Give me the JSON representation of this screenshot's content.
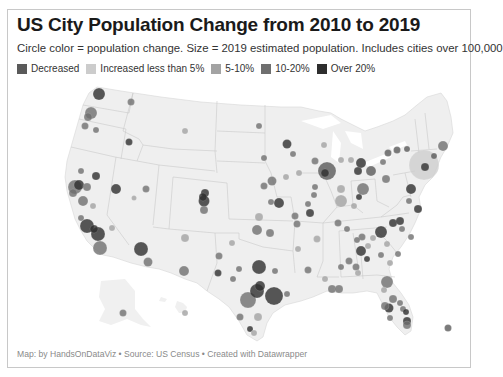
{
  "header": {
    "title": "US City Population Change from 2010 to 2019",
    "subtitle": "Circle color = population change. Size = 2019 estimated population. Includes cities over 100,000"
  },
  "legend": {
    "items": [
      {
        "label": "Decreased",
        "color": "#5a5a5a"
      },
      {
        "label": "Increased less than 5%",
        "color": "#cccccc"
      },
      {
        "label": "5-10%",
        "color": "#a3a3a3"
      },
      {
        "label": "10-20%",
        "color": "#6f6f6f"
      },
      {
        "label": "Over 20%",
        "color": "#2e2e2e"
      }
    ]
  },
  "footer": {
    "text": "Map: by HandsOnDataViz • Source: US Census • Created with Datawrapper"
  },
  "chart_data": {
    "type": "scatter",
    "subtype": "proportional-symbol map",
    "title": "US City Population Change from 2010 to 2019",
    "subtitle": "Circle color = population change. Size = 2019 estimated population. Includes cities over 100,000",
    "legend_position": "top",
    "legend": [
      "Decreased",
      "Increased less than 5%",
      "5-10%",
      "10-20%",
      "Over 20%"
    ],
    "encoding": {
      "color": "population change category",
      "size": "2019 estimated population"
    },
    "source": "US Census",
    "credit": "Map: by HandsOnDataViz",
    "points": [
      {
        "x": 98,
        "y": 93,
        "r": 6,
        "cat": "Over 20%"
      },
      {
        "x": 130,
        "y": 101,
        "r": 3.5,
        "cat": "10-20%"
      },
      {
        "x": 90,
        "y": 112,
        "r": 6,
        "cat": "10-20%"
      },
      {
        "x": 87,
        "y": 116,
        "r": 4,
        "cat": "10-20%"
      },
      {
        "x": 84,
        "y": 125,
        "r": 3.5,
        "cat": "10-20%"
      },
      {
        "x": 95,
        "y": 129,
        "r": 3,
        "cat": "10-20%"
      },
      {
        "x": 128,
        "y": 141,
        "r": 3.5,
        "cat": "Over 20%"
      },
      {
        "x": 184,
        "y": 130,
        "r": 3,
        "cat": "5-10%"
      },
      {
        "x": 80,
        "y": 170,
        "r": 3,
        "cat": "10-20%"
      },
      {
        "x": 95,
        "y": 175,
        "r": 4,
        "cat": "Over 20%"
      },
      {
        "x": 74,
        "y": 186,
        "r": 7,
        "cat": "10-20%"
      },
      {
        "x": 78,
        "y": 184,
        "r": 5,
        "cat": "Over 20%"
      },
      {
        "x": 72,
        "y": 192,
        "r": 4,
        "cat": "10-20%"
      },
      {
        "x": 86,
        "y": 186,
        "r": 4,
        "cat": "10-20%"
      },
      {
        "x": 82,
        "y": 200,
        "r": 5,
        "cat": "10-20%"
      },
      {
        "x": 92,
        "y": 205,
        "r": 3,
        "cat": "5-10%"
      },
      {
        "x": 115,
        "y": 188,
        "r": 5,
        "cat": "Over 20%"
      },
      {
        "x": 145,
        "y": 188,
        "r": 3.5,
        "cat": "10-20%"
      },
      {
        "x": 133,
        "y": 197,
        "r": 2.5,
        "cat": "5-10%"
      },
      {
        "x": 80,
        "y": 217,
        "r": 3,
        "cat": "10-20%"
      },
      {
        "x": 86,
        "y": 225,
        "r": 7,
        "cat": "Over 20%"
      },
      {
        "x": 97,
        "y": 233,
        "r": 7,
        "cat": "Over 20%"
      },
      {
        "x": 93,
        "y": 228,
        "r": 4,
        "cat": "Over 20%"
      },
      {
        "x": 99,
        "y": 247,
        "r": 7,
        "cat": "10-20%"
      },
      {
        "x": 111,
        "y": 227,
        "r": 3,
        "cat": "5-10%"
      },
      {
        "x": 140,
        "y": 248,
        "r": 7,
        "cat": "Over 20%"
      },
      {
        "x": 147,
        "y": 261,
        "r": 4.5,
        "cat": "10-20%"
      },
      {
        "x": 184,
        "y": 237,
        "r": 4,
        "cat": "5-10%"
      },
      {
        "x": 183,
        "y": 270,
        "r": 5,
        "cat": "10-20%"
      },
      {
        "x": 204,
        "y": 192,
        "r": 4,
        "cat": "Over 20%"
      },
      {
        "x": 203,
        "y": 200,
        "r": 5.5,
        "cat": "Over 20%"
      },
      {
        "x": 202,
        "y": 196,
        "r": 4,
        "cat": "Over 20%"
      },
      {
        "x": 203,
        "y": 209,
        "r": 4,
        "cat": "10-20%"
      },
      {
        "x": 258,
        "y": 125,
        "r": 3,
        "cat": "10-20%"
      },
      {
        "x": 263,
        "y": 157,
        "r": 3,
        "cat": "10-20%"
      },
      {
        "x": 271,
        "y": 180,
        "r": 4.5,
        "cat": "10-20%"
      },
      {
        "x": 263,
        "y": 185,
        "r": 3.5,
        "cat": "10-20%"
      },
      {
        "x": 286,
        "y": 143,
        "r": 4.5,
        "cat": "Over 20%"
      },
      {
        "x": 292,
        "y": 153,
        "r": 3,
        "cat": "10-20%"
      },
      {
        "x": 285,
        "y": 176,
        "r": 3,
        "cat": "5-10%"
      },
      {
        "x": 298,
        "y": 172,
        "r": 3,
        "cat": "5-10%"
      },
      {
        "x": 270,
        "y": 201,
        "r": 3,
        "cat": "10-20%"
      },
      {
        "x": 278,
        "y": 202,
        "r": 5,
        "cat": "Over 20%"
      },
      {
        "x": 307,
        "y": 203,
        "r": 3,
        "cat": "10-20%"
      },
      {
        "x": 294,
        "y": 215,
        "r": 3.5,
        "cat": "10-20%"
      },
      {
        "x": 258,
        "y": 216,
        "r": 4,
        "cat": "5-10%"
      },
      {
        "x": 326,
        "y": 170,
        "r": 9,
        "cat": "Decreased"
      },
      {
        "x": 324,
        "y": 172,
        "r": 4,
        "cat": "Over 20%"
      },
      {
        "x": 314,
        "y": 160,
        "r": 3.5,
        "cat": "10-20%"
      },
      {
        "x": 340,
        "y": 159,
        "r": 3,
        "cat": "5-10%"
      },
      {
        "x": 350,
        "y": 159,
        "r": 3,
        "cat": "5-10%"
      },
      {
        "x": 360,
        "y": 162,
        "r": 5,
        "cat": "Over 20%"
      },
      {
        "x": 357,
        "y": 170,
        "r": 4,
        "cat": "Over 20%"
      },
      {
        "x": 323,
        "y": 144,
        "r": 3,
        "cat": "5-10%"
      },
      {
        "x": 314,
        "y": 186,
        "r": 3,
        "cat": "10-20%"
      },
      {
        "x": 313,
        "y": 194,
        "r": 3,
        "cat": "10-20%"
      },
      {
        "x": 340,
        "y": 188,
        "r": 4,
        "cat": "5-10%"
      },
      {
        "x": 340,
        "y": 200,
        "r": 6,
        "cat": "5-10%"
      },
      {
        "x": 362,
        "y": 188,
        "r": 6,
        "cat": "10-20%"
      },
      {
        "x": 358,
        "y": 196,
        "r": 3,
        "cat": "Over 20%"
      },
      {
        "x": 353,
        "y": 205,
        "r": 3,
        "cat": "5-10%"
      },
      {
        "x": 370,
        "y": 170,
        "r": 5,
        "cat": "Decreased"
      },
      {
        "x": 382,
        "y": 161,
        "r": 3,
        "cat": "10-20%"
      },
      {
        "x": 385,
        "y": 178,
        "r": 4,
        "cat": "10-20%"
      },
      {
        "x": 387,
        "y": 152,
        "r": 3.5,
        "cat": "Decreased"
      },
      {
        "x": 396,
        "y": 149,
        "r": 3.5,
        "cat": "Decreased"
      },
      {
        "x": 406,
        "y": 148,
        "r": 3,
        "cat": "Decreased"
      },
      {
        "x": 423,
        "y": 164,
        "r": 15,
        "cat": "Increased less than 5%"
      },
      {
        "x": 424,
        "y": 166,
        "r": 4,
        "cat": "Over 20%"
      },
      {
        "x": 433,
        "y": 155,
        "r": 3,
        "cat": "Decreased"
      },
      {
        "x": 442,
        "y": 145,
        "r": 5,
        "cat": "10-20%"
      },
      {
        "x": 410,
        "y": 188,
        "r": 5,
        "cat": "Over 20%"
      },
      {
        "x": 408,
        "y": 200,
        "r": 3,
        "cat": "10-20%"
      },
      {
        "x": 417,
        "y": 208,
        "r": 4,
        "cat": "Over 20%"
      },
      {
        "x": 256,
        "y": 229,
        "r": 5,
        "cat": "10-20%"
      },
      {
        "x": 269,
        "y": 232,
        "r": 4,
        "cat": "10-20%"
      },
      {
        "x": 231,
        "y": 242,
        "r": 3,
        "cat": "5-10%"
      },
      {
        "x": 296,
        "y": 223,
        "r": 3.5,
        "cat": "10-20%"
      },
      {
        "x": 309,
        "y": 212,
        "r": 4,
        "cat": "Over 20%"
      },
      {
        "x": 297,
        "y": 248,
        "r": 3,
        "cat": "5-10%"
      },
      {
        "x": 316,
        "y": 238,
        "r": 3.5,
        "cat": "5-10%"
      },
      {
        "x": 218,
        "y": 255,
        "r": 3.5,
        "cat": "10-20%"
      },
      {
        "x": 258,
        "y": 266,
        "r": 7,
        "cat": "Over 20%"
      },
      {
        "x": 274,
        "y": 270,
        "r": 3,
        "cat": "10-20%"
      },
      {
        "x": 238,
        "y": 268,
        "r": 3,
        "cat": "10-20%"
      },
      {
        "x": 217,
        "y": 272,
        "r": 3.5,
        "cat": "Over 20%"
      },
      {
        "x": 232,
        "y": 278,
        "r": 3,
        "cat": "10-20%"
      },
      {
        "x": 259,
        "y": 285,
        "r": 5,
        "cat": "Over 20%"
      },
      {
        "x": 256,
        "y": 290,
        "r": 7,
        "cat": "Over 20%"
      },
      {
        "x": 247,
        "y": 299,
        "r": 8,
        "cat": "10-20%"
      },
      {
        "x": 273,
        "y": 295,
        "r": 9,
        "cat": "Over 20%"
      },
      {
        "x": 286,
        "y": 293,
        "r": 3,
        "cat": "10-20%"
      },
      {
        "x": 239,
        "y": 316,
        "r": 3.5,
        "cat": "10-20%"
      },
      {
        "x": 257,
        "y": 316,
        "r": 4,
        "cat": "5-10%"
      },
      {
        "x": 249,
        "y": 328,
        "r": 3,
        "cat": "Over 20%"
      },
      {
        "x": 253,
        "y": 332,
        "r": 3,
        "cat": "5-10%"
      },
      {
        "x": 307,
        "y": 269,
        "r": 3.5,
        "cat": "10-20%"
      },
      {
        "x": 324,
        "y": 278,
        "r": 3,
        "cat": "5-10%"
      },
      {
        "x": 331,
        "y": 288,
        "r": 4,
        "cat": "10-20%"
      },
      {
        "x": 338,
        "y": 288,
        "r": 4,
        "cat": "10-20%"
      },
      {
        "x": 337,
        "y": 222,
        "r": 3.5,
        "cat": "10-20%"
      },
      {
        "x": 346,
        "y": 228,
        "r": 3,
        "cat": "10-20%"
      },
      {
        "x": 356,
        "y": 239,
        "r": 3,
        "cat": "10-20%"
      },
      {
        "x": 361,
        "y": 236,
        "r": 3.5,
        "cat": "10-20%"
      },
      {
        "x": 372,
        "y": 237,
        "r": 3,
        "cat": "5-10%"
      },
      {
        "x": 340,
        "y": 266,
        "r": 3,
        "cat": "10-20%"
      },
      {
        "x": 348,
        "y": 260,
        "r": 3.5,
        "cat": "10-20%"
      },
      {
        "x": 355,
        "y": 266,
        "r": 3.5,
        "cat": "10-20%"
      },
      {
        "x": 360,
        "y": 250,
        "r": 5,
        "cat": "Over 20%"
      },
      {
        "x": 367,
        "y": 245,
        "r": 3,
        "cat": "5-10%"
      },
      {
        "x": 366,
        "y": 258,
        "r": 3,
        "cat": "Over 20%"
      },
      {
        "x": 357,
        "y": 272,
        "r": 3,
        "cat": "5-10%"
      },
      {
        "x": 380,
        "y": 231,
        "r": 6,
        "cat": "Over 20%"
      },
      {
        "x": 392,
        "y": 222,
        "r": 4,
        "cat": "Over 20%"
      },
      {
        "x": 399,
        "y": 220,
        "r": 4,
        "cat": "Over 20%"
      },
      {
        "x": 401,
        "y": 228,
        "r": 3,
        "cat": "10-20%"
      },
      {
        "x": 386,
        "y": 243,
        "r": 3,
        "cat": "5-10%"
      },
      {
        "x": 380,
        "y": 254,
        "r": 3,
        "cat": "10-20%"
      },
      {
        "x": 397,
        "y": 253,
        "r": 3,
        "cat": "10-20%"
      },
      {
        "x": 410,
        "y": 236,
        "r": 3,
        "cat": "10-20%"
      },
      {
        "x": 389,
        "y": 262,
        "r": 3,
        "cat": "5-10%"
      },
      {
        "x": 386,
        "y": 281,
        "r": 6,
        "cat": "10-20%"
      },
      {
        "x": 383,
        "y": 289,
        "r": 3,
        "cat": "5-10%"
      },
      {
        "x": 392,
        "y": 298,
        "r": 4,
        "cat": "10-20%"
      },
      {
        "x": 384,
        "y": 305,
        "r": 4,
        "cat": "10-20%"
      },
      {
        "x": 388,
        "y": 307,
        "r": 4.5,
        "cat": "Over 20%"
      },
      {
        "x": 399,
        "y": 302,
        "r": 3,
        "cat": "10-20%"
      },
      {
        "x": 402,
        "y": 308,
        "r": 3,
        "cat": "10-20%"
      },
      {
        "x": 405,
        "y": 311,
        "r": 3,
        "cat": "Over 20%"
      },
      {
        "x": 389,
        "y": 317,
        "r": 3,
        "cat": "10-20%"
      },
      {
        "x": 406,
        "y": 320,
        "r": 4,
        "cat": "Over 20%"
      },
      {
        "x": 406,
        "y": 324,
        "r": 4,
        "cat": "10-20%"
      },
      {
        "x": 447,
        "y": 327,
        "r": 3.5,
        "cat": "Decreased"
      },
      {
        "x": 122,
        "y": 312,
        "r": 3.5,
        "cat": "10-20%"
      },
      {
        "x": 184,
        "y": 312,
        "r": 3,
        "cat": "5-10%"
      }
    ]
  }
}
